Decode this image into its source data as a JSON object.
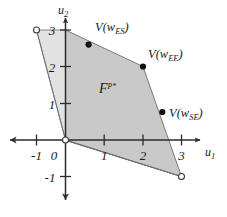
{
  "figure": {
    "background_color": "#ffffff",
    "axis_color": "#2b2b2b",
    "edge_color": "#555555",
    "region_fill_main": "#c9c9c9",
    "region_fill_light": "#e2e2e2",
    "marker_fill": "#111111",
    "marker_open_fill": "#ffffff"
  },
  "axes": {
    "x_axis_name": "u",
    "x_axis_sub": "1",
    "y_axis_name": "u",
    "y_axis_sub": "2",
    "x_ticks": [
      "-1",
      "1",
      "2",
      "3"
    ],
    "y_ticks": [
      "3",
      "2",
      "1",
      "-1"
    ],
    "origin_label": "0",
    "x_range": [
      -1.6,
      3.9
    ],
    "y_range": [
      -1.7,
      3.6
    ]
  },
  "region": {
    "label_main": "F",
    "label_sup": "P*",
    "polygon_main": [
      [
        0,
        0
      ],
      [
        0.0,
        3.0
      ],
      [
        2.0,
        2.0
      ],
      [
        3.0,
        -1.0
      ]
    ],
    "polygon_left": [
      [
        -1.0,
        3.0
      ],
      [
        0.0,
        3.0
      ],
      [
        0.0,
        0.0
      ]
    ],
    "polygon_bottom": [
      [
        0.0,
        0.0
      ],
      [
        3.0,
        -1.0
      ],
      [
        0.0,
        -0.02
      ]
    ]
  },
  "vertices": [
    {
      "name": "V(w_ES)",
      "label_prefix": "V(w",
      "label_sub": "ES",
      "label_suffix": ")",
      "x": 0.6,
      "y": 2.6,
      "marker": "filled"
    },
    {
      "name": "V(w_EE)",
      "label_prefix": "V(w",
      "label_sub": "EE",
      "label_suffix": ")",
      "x": 2.0,
      "y": 2.0,
      "marker": "filled"
    },
    {
      "name": "V(w_SE)",
      "label_prefix": "V(w",
      "label_sub": "SE",
      "label_suffix": ")",
      "x": 2.5,
      "y": 0.75,
      "marker": "filled"
    }
  ],
  "open_points": [
    {
      "name": "upper-left-open-point",
      "x": -1.0,
      "y": 3.0
    },
    {
      "name": "origin-open-point",
      "x": 0.0,
      "y": 0.0
    },
    {
      "name": "lower-right-open-point",
      "x": 3.0,
      "y": -1.0
    }
  ]
}
